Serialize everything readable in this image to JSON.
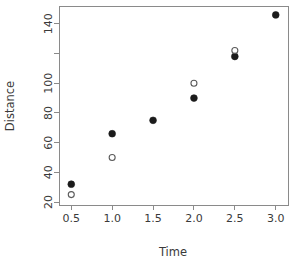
{
  "chart_data": {
    "type": "scatter",
    "title": "",
    "xlabel": "Time",
    "ylabel": "Distance",
    "xlim": [
      0.35,
      3.15
    ],
    "ylim": [
      18,
      152
    ],
    "grid": false,
    "legend": "none",
    "x_ticks": [
      0.5,
      1.0,
      1.5,
      2.0,
      2.5,
      3.0
    ],
    "x_tick_labels": [
      "0.5",
      "1.0",
      "1.5",
      "2.0",
      "2.5",
      "3.0"
    ],
    "y_ticks": [
      20,
      40,
      60,
      80,
      100,
      120,
      140
    ],
    "y_tick_labels": [
      "20",
      "40",
      "60",
      "80",
      "100",
      "",
      "140"
    ],
    "series": [
      {
        "name": "filled-series",
        "marker": "filled-circle",
        "color": "#1b1b1b",
        "x": [
          0.5,
          1.0,
          1.5,
          2.0,
          2.5,
          3.0
        ],
        "values": [
          32,
          66,
          75,
          90,
          118,
          146
        ]
      },
      {
        "name": "open-series",
        "marker": "open-circle",
        "color": "#5a5a5a",
        "x": [
          0.5,
          1.0,
          2.0,
          2.5
        ],
        "values": [
          25,
          50,
          100,
          122
        ]
      }
    ]
  },
  "axes": {
    "x_title": "Time",
    "y_title": "Distance"
  }
}
